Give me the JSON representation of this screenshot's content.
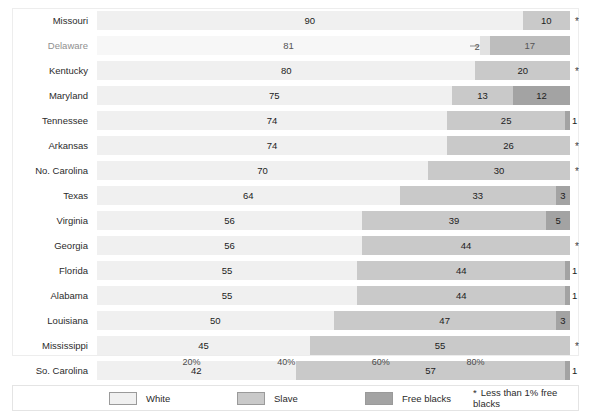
{
  "chart_data": {
    "type": "bar",
    "orientation": "horizontal",
    "stacked": true,
    "stacked_percent": true,
    "title": "",
    "subtitle": "",
    "xlabel": "",
    "ylabel": "",
    "xlim": [
      0,
      100
    ],
    "grid": false,
    "legend_position": "bottom",
    "categories": [
      "Missouri",
      "Delaware",
      "Kentucky",
      "Maryland",
      "Tennessee",
      "Arkansas",
      "No. Carolina",
      "Texas",
      "Virginia",
      "Georgia",
      "Florida",
      "Alabama",
      "Louisiana",
      "Mississippi",
      "So. Carolina"
    ],
    "series": [
      {
        "name": "White",
        "color": "#f0f0f0",
        "values": [
          90,
          81,
          80,
          75,
          74,
          74,
          70,
          64,
          56,
          56,
          55,
          55,
          50,
          45,
          42
        ]
      },
      {
        "name": "Slave",
        "color": "#c9c9c9",
        "values": [
          10,
          2,
          20,
          13,
          25,
          26,
          30,
          33,
          39,
          44,
          44,
          44,
          47,
          55,
          57
        ]
      },
      {
        "name": "Free blacks",
        "color": "#a3a3a3",
        "values": [
          0,
          17,
          0,
          12,
          1,
          0,
          0,
          3,
          5,
          0,
          1,
          1,
          3,
          0,
          1
        ]
      }
    ],
    "free_blacks_display": [
      "*",
      "17",
      "*",
      "12",
      "1",
      "*",
      "*",
      "3",
      "5",
      "*",
      "1",
      "1",
      "3",
      "*",
      "1"
    ],
    "tick_labels": [
      "20%",
      "40%",
      "60%",
      "80%"
    ],
    "tick_values": [
      20,
      40,
      60,
      80
    ],
    "annotations": [
      {
        "row": "Delaware",
        "text": "2",
        "series": "Slave",
        "style": "leader-line-outside"
      }
    ],
    "footnote": "Less than 1% free blacks",
    "footnote_marker": "*"
  },
  "rows": [
    {
      "label": "Missouri",
      "white": 90,
      "slave": 10,
      "free": 0,
      "white_label": "90",
      "slave_label": "10",
      "free_label": "*",
      "free_outside": true,
      "faded": false
    },
    {
      "label": "Delaware",
      "white": 81,
      "slave": 2,
      "free": 17,
      "white_label": "81",
      "slave_label": "2",
      "free_label": "17",
      "slave_outside": true,
      "faded": true
    },
    {
      "label": "Kentucky",
      "white": 80,
      "slave": 20,
      "free": 0,
      "white_label": "80",
      "slave_label": "20",
      "free_label": "*",
      "free_outside": true,
      "faded": false
    },
    {
      "label": "Maryland",
      "white": 75,
      "slave": 13,
      "free": 12,
      "white_label": "75",
      "slave_label": "13",
      "free_label": "12",
      "faded": false
    },
    {
      "label": "Tennessee",
      "white": 74,
      "slave": 25,
      "free": 1,
      "white_label": "74",
      "slave_label": "25",
      "free_label": "1",
      "free_outside": true,
      "faded": false
    },
    {
      "label": "Arkansas",
      "white": 74,
      "slave": 26,
      "free": 0,
      "white_label": "74",
      "slave_label": "26",
      "free_label": "*",
      "free_outside": true,
      "faded": false
    },
    {
      "label": "No. Carolina",
      "white": 70,
      "slave": 30,
      "free": 0,
      "white_label": "70",
      "slave_label": "30",
      "free_label": "*",
      "free_outside": true,
      "faded": false
    },
    {
      "label": "Texas",
      "white": 64,
      "slave": 33,
      "free": 3,
      "white_label": "64",
      "slave_label": "33",
      "free_label": "3",
      "faded": false
    },
    {
      "label": "Virginia",
      "white": 56,
      "slave": 39,
      "free": 5,
      "white_label": "56",
      "slave_label": "39",
      "free_label": "5",
      "faded": false
    },
    {
      "label": "Georgia",
      "white": 56,
      "slave": 44,
      "free": 0,
      "white_label": "56",
      "slave_label": "44",
      "free_label": "*",
      "free_outside": true,
      "faded": false
    },
    {
      "label": "Florida",
      "white": 55,
      "slave": 44,
      "free": 1,
      "white_label": "55",
      "slave_label": "44",
      "free_label": "1",
      "free_outside": true,
      "faded": false
    },
    {
      "label": "Alabama",
      "white": 55,
      "slave": 44,
      "free": 1,
      "white_label": "55",
      "slave_label": "44",
      "free_label": "1",
      "free_outside": true,
      "faded": false
    },
    {
      "label": "Louisiana",
      "white": 50,
      "slave": 47,
      "free": 3,
      "white_label": "50",
      "slave_label": "47",
      "free_label": "3",
      "faded": false
    },
    {
      "label": "Mississippi",
      "white": 45,
      "slave": 55,
      "free": 0,
      "white_label": "45",
      "slave_label": "55",
      "free_label": "*",
      "free_outside": true,
      "faded": false
    },
    {
      "label": "So. Carolina",
      "white": 42,
      "slave": 57,
      "free": 1,
      "white_label": "42",
      "slave_label": "57",
      "free_label": "1",
      "free_outside": true,
      "faded": false
    }
  ],
  "axis": {
    "ticks": [
      {
        "label": "20%",
        "value": 20
      },
      {
        "label": "40%",
        "value": 40
      },
      {
        "label": "60%",
        "value": 60
      },
      {
        "label": "80%",
        "value": 80
      }
    ]
  },
  "legend": {
    "items": [
      {
        "label": "White",
        "color": "#f0f0f0",
        "swatch_class": "sw-white"
      },
      {
        "label": "Slave",
        "color": "#c9c9c9",
        "swatch_class": "sw-slave"
      },
      {
        "label": "Free blacks",
        "color": "#a3a3a3",
        "swatch_class": "sw-free"
      }
    ],
    "note_marker": "*",
    "note": "Less than 1% free blacks"
  }
}
